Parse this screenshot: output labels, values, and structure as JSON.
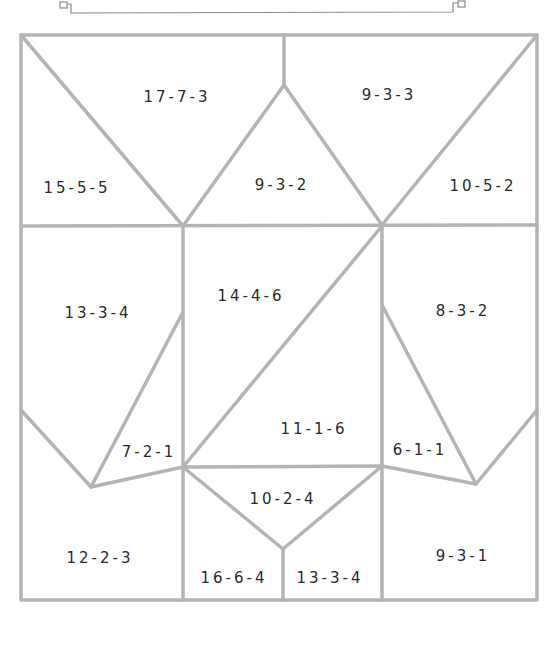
{
  "diagram": {
    "stroke_color": "#b4b4b4",
    "bracket_color": "#888888",
    "regions": [
      {
        "id": "r1",
        "label": "17-7-3",
        "x": 177,
        "y": 97
      },
      {
        "id": "r2",
        "label": "9-3-3",
        "x": 389,
        "y": 95
      },
      {
        "id": "r3",
        "label": "15-5-5",
        "x": 77,
        "y": 188
      },
      {
        "id": "r4",
        "label": "9-3-2",
        "x": 282,
        "y": 185
      },
      {
        "id": "r5",
        "label": "10-5-2",
        "x": 483,
        "y": 186
      },
      {
        "id": "r6",
        "label": "14-4-6",
        "x": 251,
        "y": 296
      },
      {
        "id": "r7",
        "label": "13-3-4",
        "x": 98,
        "y": 313
      },
      {
        "id": "r8",
        "label": "8-3-2",
        "x": 463,
        "y": 311
      },
      {
        "id": "r9",
        "label": "11-1-6",
        "x": 314,
        "y": 429
      },
      {
        "id": "r10",
        "label": "7-2-1",
        "x": 149,
        "y": 452
      },
      {
        "id": "r11",
        "label": "6-1-1",
        "x": 420,
        "y": 450
      },
      {
        "id": "r12",
        "label": "10-2-4",
        "x": 283,
        "y": 499
      },
      {
        "id": "r13",
        "label": "12-2-3",
        "x": 100,
        "y": 558
      },
      {
        "id": "r14",
        "label": "9-3-1",
        "x": 463,
        "y": 556
      },
      {
        "id": "r15",
        "label": "16-6-4",
        "x": 234,
        "y": 578
      },
      {
        "id": "r16",
        "label": "13-3-4",
        "x": 330,
        "y": 578
      }
    ]
  }
}
